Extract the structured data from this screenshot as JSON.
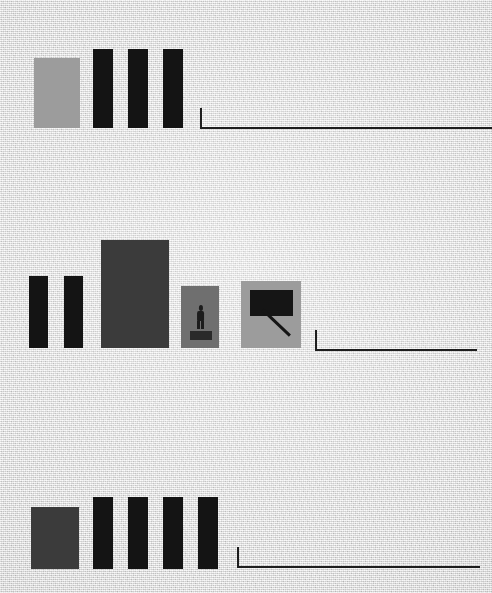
{
  "canvas": {
    "width": 492,
    "height": 593,
    "background_color": "#e1e1e1",
    "texture": "paper-grain"
  },
  "palette": {
    "background": "#e1e1e1",
    "ink_black": "#141414",
    "dark_gray": "#3b3b3b",
    "mid_gray": "#6f6f6f",
    "light_gray": "#9c9c9c",
    "rule_line": "#1d1d1d"
  },
  "groups": [
    {
      "id": "group-top",
      "name": "top-block-row",
      "blocks": [
        {
          "name": "swatch-light-1",
          "x": 34,
          "y": 58,
          "w": 46,
          "h": 70,
          "color": "#9c9c9c"
        },
        {
          "name": "bar-1",
          "x": 93,
          "y": 49,
          "w": 20,
          "h": 79,
          "color": "#141414"
        },
        {
          "name": "bar-2",
          "x": 128,
          "y": 49,
          "w": 20,
          "h": 79,
          "color": "#141414"
        },
        {
          "name": "bar-3",
          "x": 163,
          "y": 49,
          "w": 20,
          "h": 79,
          "color": "#141414"
        }
      ],
      "rule": {
        "name": "rule-top",
        "x": 200,
        "y": 108,
        "w": 292,
        "h": 21
      }
    },
    {
      "id": "group-middle",
      "name": "middle-block-row",
      "blocks": [
        {
          "name": "bar-4",
          "x": 29,
          "y": 276,
          "w": 19,
          "h": 72,
          "color": "#141414"
        },
        {
          "name": "bar-5",
          "x": 64,
          "y": 276,
          "w": 19,
          "h": 72,
          "color": "#141414"
        },
        {
          "name": "panel-large",
          "x": 101,
          "y": 240,
          "w": 68,
          "h": 108,
          "color": "#3b3b3b"
        },
        {
          "name": "panel-figure",
          "x": 181,
          "y": 286,
          "w": 38,
          "h": 62,
          "color": "#6f6f6f"
        },
        {
          "name": "panel-callout",
          "x": 241,
          "y": 281,
          "w": 60,
          "h": 67,
          "color": "#9c9c9c"
        }
      ],
      "icons": [
        {
          "name": "person-icon",
          "x": 195,
          "y": 305,
          "w": 11,
          "h": 24
        },
        {
          "name": "person-base",
          "x": 190,
          "y": 331,
          "w": 22,
          "h": 9
        },
        {
          "name": "callout-icon",
          "x": 250,
          "y": 290,
          "w": 43,
          "h": 44
        }
      ],
      "rule": {
        "name": "rule-middle",
        "x": 315,
        "y": 330,
        "w": 162,
        "h": 21
      }
    },
    {
      "id": "group-bottom",
      "name": "bottom-block-row",
      "blocks": [
        {
          "name": "swatch-dark-1",
          "x": 31,
          "y": 507,
          "w": 48,
          "h": 62,
          "color": "#3b3b3b"
        },
        {
          "name": "bar-6",
          "x": 93,
          "y": 497,
          "w": 20,
          "h": 72,
          "color": "#141414"
        },
        {
          "name": "bar-7",
          "x": 128,
          "y": 497,
          "w": 20,
          "h": 72,
          "color": "#141414"
        },
        {
          "name": "bar-8",
          "x": 163,
          "y": 497,
          "w": 20,
          "h": 72,
          "color": "#141414"
        },
        {
          "name": "bar-9",
          "x": 198,
          "y": 497,
          "w": 20,
          "h": 72,
          "color": "#141414"
        }
      ],
      "rule": {
        "name": "rule-bottom",
        "x": 237,
        "y": 547,
        "w": 243,
        "h": 21
      }
    }
  ]
}
